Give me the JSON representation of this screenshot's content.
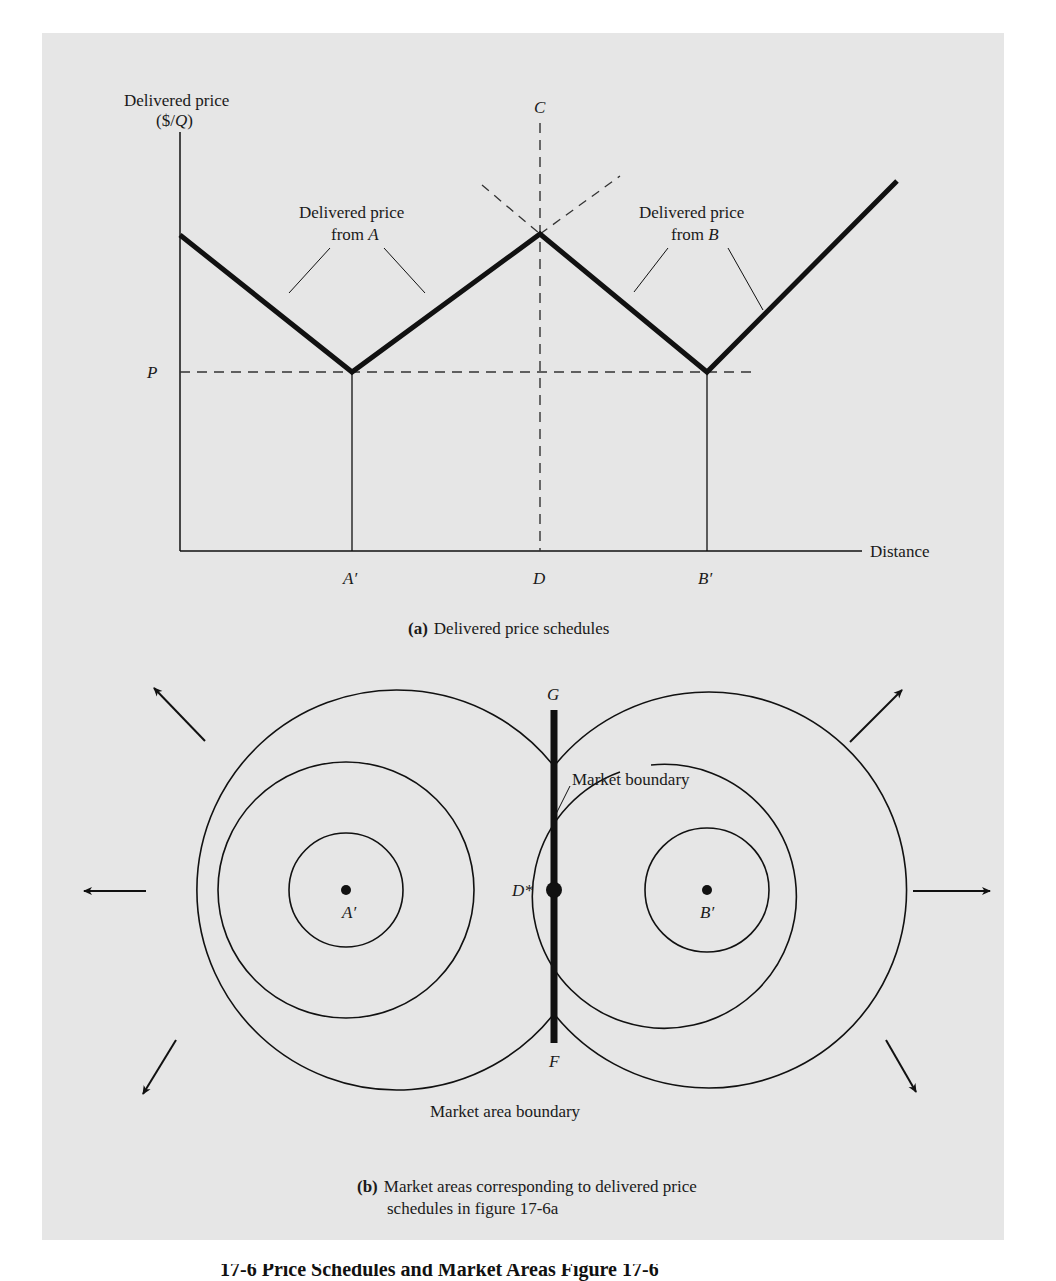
{
  "figure": {
    "panel_a": {
      "y_axis_label_line1": "Delivered price",
      "y_axis_label_line2": "($/Q)",
      "x_axis_label": "Distance",
      "price_level_label": "P",
      "point_c_label": "C",
      "x_ticks": [
        "A′",
        "D",
        "B′"
      ],
      "annotation_a_line1": "Delivered price",
      "annotation_a_line2_prefix": "from ",
      "annotation_a_line2_var": "A",
      "annotation_b_line1": "Delivered price",
      "annotation_b_line2_prefix": "from ",
      "annotation_b_line2_var": "B",
      "caption_tag": "(a)",
      "caption_text": "Delivered price schedules"
    },
    "panel_b": {
      "label_g": "G",
      "label_f": "F",
      "label_d_star": "D*",
      "center_a_label": "A′",
      "center_b_label": "B′",
      "market_boundary_label": "Market boundary",
      "market_area_boundary_label": "Market area boundary",
      "caption_tag": "(b)",
      "caption_line1": "Market areas corresponding to delivered price",
      "caption_line2": "schedules in figure 17-6a"
    }
  },
  "page_caption_partial": "17-6  Price Schedules and Market Areas  Figure 17-6"
}
